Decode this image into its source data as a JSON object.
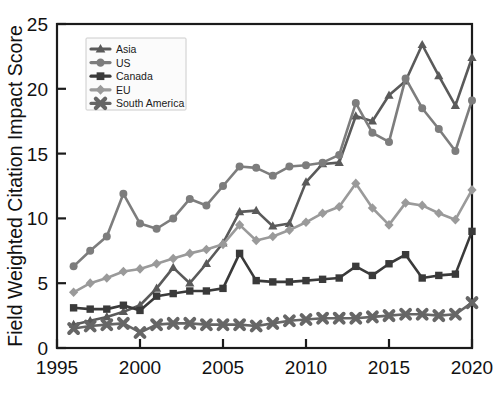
{
  "chart_data": {
    "type": "line",
    "title": "",
    "xlabel": "",
    "ylabel": "Field Weighted Citation Impact Score",
    "xlim": [
      1995,
      2020
    ],
    "ylim": [
      0,
      25
    ],
    "xticks": [
      1995,
      2000,
      2005,
      2010,
      2015,
      2020
    ],
    "yticks": [
      0,
      5,
      10,
      15,
      20,
      25
    ],
    "grid": false,
    "legend_position": "upper-left",
    "x": [
      1996,
      1997,
      1998,
      1999,
      2000,
      2001,
      2002,
      2003,
      2004,
      2005,
      2006,
      2007,
      2008,
      2009,
      2010,
      2011,
      2012,
      2013,
      2014,
      2015,
      2016,
      2017,
      2018,
      2019,
      2020
    ],
    "series": [
      {
        "name": "Asia",
        "marker": "triangle",
        "color": "#5a5a5a",
        "values": [
          1.8,
          2.1,
          2.4,
          2.8,
          3.3,
          4.6,
          6.2,
          5.0,
          6.5,
          8.1,
          10.5,
          10.6,
          9.4,
          9.6,
          12.8,
          14.2,
          14.3,
          17.9,
          17.5,
          19.5,
          20.6,
          23.4,
          21.0,
          18.7,
          22.4
        ]
      },
      {
        "name": "US",
        "marker": "circle",
        "color": "#7d7d7d",
        "values": [
          6.3,
          7.5,
          8.6,
          11.9,
          9.6,
          9.2,
          10.0,
          11.5,
          11.0,
          12.5,
          14.0,
          13.9,
          13.3,
          14.0,
          14.1,
          14.3,
          14.9,
          18.9,
          16.6,
          15.9,
          20.8,
          18.5,
          16.9,
          15.2,
          19.1
        ]
      },
      {
        "name": "Canada",
        "marker": "square",
        "color": "#3a3a3a",
        "values": [
          3.1,
          3.0,
          3.0,
          3.3,
          2.9,
          4.0,
          4.2,
          4.4,
          4.4,
          4.6,
          7.3,
          5.2,
          5.1,
          5.1,
          5.2,
          5.3,
          5.4,
          6.3,
          5.6,
          6.5,
          7.2,
          5.4,
          5.6,
          5.7,
          9.0
        ]
      },
      {
        "name": "EU",
        "marker": "diamond",
        "color": "#9a9a9a",
        "values": [
          4.3,
          5.0,
          5.4,
          5.9,
          6.1,
          6.5,
          6.9,
          7.3,
          7.6,
          8.0,
          9.5,
          8.3,
          8.6,
          9.1,
          9.7,
          10.4,
          10.9,
          12.7,
          10.8,
          9.5,
          11.2,
          11.0,
          10.4,
          9.9,
          12.2
        ]
      },
      {
        "name": "South America",
        "marker": "x",
        "color": "#666666",
        "values": [
          1.5,
          1.7,
          1.8,
          1.9,
          1.2,
          1.8,
          1.9,
          1.9,
          1.8,
          1.8,
          1.8,
          1.7,
          1.9,
          2.1,
          2.2,
          2.3,
          2.3,
          2.3,
          2.4,
          2.5,
          2.6,
          2.6,
          2.5,
          2.6,
          3.5
        ]
      }
    ]
  },
  "legend": {
    "items": [
      {
        "label": "Asia"
      },
      {
        "label": "US"
      },
      {
        "label": "Canada"
      },
      {
        "label": "EU"
      },
      {
        "label": "South America"
      }
    ]
  }
}
